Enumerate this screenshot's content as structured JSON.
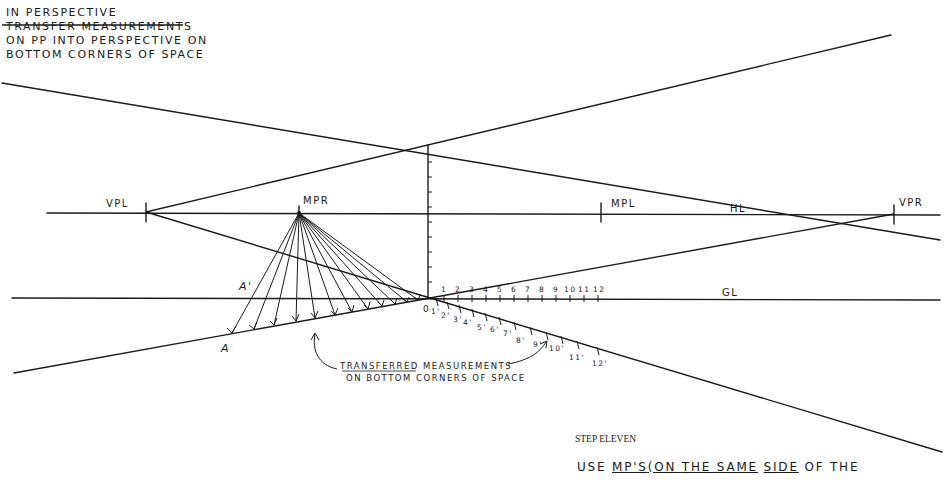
{
  "title": {
    "heading": "IN  PERSPECTIVE",
    "lines": [
      "TRANSFER  MEASUREMENTS",
      " ON  PP  INTO  PERSPECTIVE  ON",
      " BOTTOM  CORNERS  OF  SPACE"
    ]
  },
  "labels": {
    "vpl": "VPL",
    "vpr": "VPR",
    "mpr": "MPR",
    "mpl": "MPL",
    "hl": "HL",
    "gl": "GL",
    "a_prime": "A'",
    "a": "A",
    "origin": "0"
  },
  "scale_gl": [
    "1",
    "2",
    "3",
    "4",
    "5",
    "6",
    "7",
    "8",
    "9",
    "10",
    "11",
    "12"
  ],
  "scale_perspective": [
    "1'",
    "2'",
    "3'",
    "4'",
    "5'",
    "6'",
    "7'",
    "8'",
    "9'",
    "10'",
    "11'",
    "12'"
  ],
  "annotation": {
    "line1": "TRANSFERRED MEASUREMENTS",
    "line2": "ON  BOTTOM  CORNERS  OF  SPACE"
  },
  "step": {
    "label": "STEP ELEVEN",
    "instruction_parts": [
      "USE ",
      "MP'S",
      "(ON ",
      "THE ",
      "SAME",
      " ",
      "SIDE",
      " OF THE"
    ]
  },
  "colors": {
    "ink": "#1a1a1a",
    "paper": "#ffffff"
  }
}
